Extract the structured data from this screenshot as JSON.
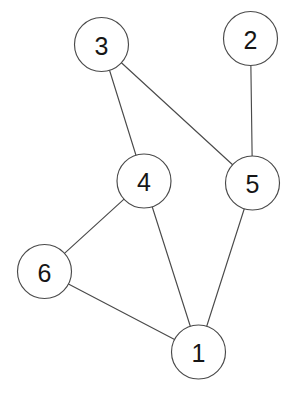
{
  "diagram": {
    "type": "node-link-graph",
    "directed": false,
    "background_color": "#ffffff",
    "stroke_color": "#4a4a4a",
    "label_color": "#161616",
    "node_fill": "#ffffff",
    "node_radius": 27,
    "width": 294,
    "height": 393,
    "nodes": [
      {
        "id": "1",
        "label": "1",
        "cx": 198.5,
        "cy": 352.0,
        "r": 27
      },
      {
        "id": "2",
        "label": "2",
        "cx": 250.5,
        "cy": 38.5,
        "r": 27
      },
      {
        "id": "3",
        "label": "3",
        "cx": 101.5,
        "cy": 44.5,
        "r": 27
      },
      {
        "id": "4",
        "label": "4",
        "cx": 144.0,
        "cy": 181.0,
        "r": 27
      },
      {
        "id": "5",
        "label": "5",
        "cx": 252.5,
        "cy": 183.0,
        "r": 27
      },
      {
        "id": "6",
        "label": "6",
        "cx": 44.5,
        "cy": 271.5,
        "r": 27
      }
    ],
    "edges": [
      {
        "source": "3",
        "target": "4"
      },
      {
        "source": "3",
        "target": "5"
      },
      {
        "source": "2",
        "target": "5"
      },
      {
        "source": "4",
        "target": "6"
      },
      {
        "source": "4",
        "target": "1"
      },
      {
        "source": "5",
        "target": "1"
      },
      {
        "source": "6",
        "target": "1"
      }
    ]
  }
}
